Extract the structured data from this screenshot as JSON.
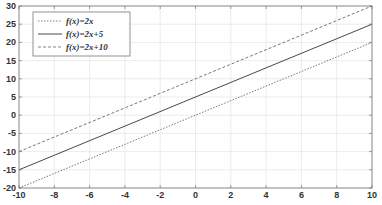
{
  "chart_data": {
    "type": "line",
    "title": "",
    "xlabel": "",
    "ylabel": "",
    "xlim": [
      -10,
      10
    ],
    "ylim": [
      -20,
      30
    ],
    "grid": true,
    "legend_position": "upper-left",
    "x_ticks": [
      -10,
      -8,
      -6,
      -4,
      -2,
      0,
      2,
      4,
      6,
      8,
      10
    ],
    "y_ticks": [
      -20,
      -15,
      -10,
      -5,
      0,
      5,
      10,
      15,
      20,
      25,
      30
    ],
    "x_tick_labels": [
      "-10",
      "-8",
      "-6",
      "-4",
      "-2",
      "0",
      "2",
      "4",
      "6",
      "8",
      "10"
    ],
    "y_tick_labels": [
      "-20",
      "-15",
      "-10",
      "-5",
      "0",
      "5",
      "10",
      "15",
      "20",
      "25",
      "30"
    ],
    "x": [
      -10,
      10
    ],
    "series": [
      {
        "name": "f(x)=2x",
        "values": [
          -20,
          20
        ],
        "line_style": "dotted",
        "color": "#555555"
      },
      {
        "name": "f(x)=2x+5",
        "values": [
          -15,
          25
        ],
        "line_style": "solid",
        "color": "#333333"
      },
      {
        "name": "f(x)=2x+10",
        "values": [
          -10,
          30
        ],
        "line_style": "dashed",
        "color": "#555555"
      }
    ]
  },
  "legend": {
    "items": [
      {
        "label": "f(x)=2x"
      },
      {
        "label": "f(x)=2x+5"
      },
      {
        "label": "f(x)=2x+10"
      }
    ]
  }
}
